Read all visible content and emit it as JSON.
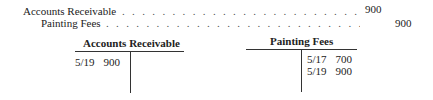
{
  "journal_entry": {
    "lines": [
      {
        "account": "Accounts Receivable",
        "debit": "900",
        "credit": ""
      },
      {
        "account": "Painting Fees",
        "debit": "",
        "credit": "900"
      }
    ],
    "leader": ". . . . . . . . . . . . . . . . . . . . . . . . . . . . . . . . . . . . . . . . . . . . ."
  },
  "t_accounts": [
    {
      "title": "Accounts Receivable",
      "debits": [
        {
          "date": "5/19",
          "amount": "900"
        }
      ],
      "credits": []
    },
    {
      "title": "Painting Fees",
      "debits": [],
      "credits": [
        {
          "date": "5/17",
          "amount": "700"
        },
        {
          "date": "5/19",
          "amount": "900"
        }
      ]
    }
  ]
}
